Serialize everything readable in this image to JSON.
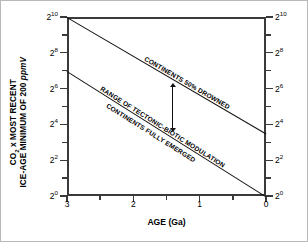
{
  "chart_data": {
    "type": "line",
    "title": "",
    "xlabel": "AGE (Ga)",
    "ylabel_line1": "CO",
    "ylabel_sub": "2",
    "ylabel_line1b": " x MOST RECENT",
    "ylabel_line2": "ICE-AGE MINIMUM OF 200 ",
    "ylabel_line2_italic": "ppmV",
    "xlim": [
      3,
      0
    ],
    "ylim_exponent": [
      0,
      10
    ],
    "y_scale": "log2",
    "grid": false,
    "legend": "none",
    "x_major_ticks": [
      "3",
      "2",
      "1",
      "0"
    ],
    "x_major_values": [
      3,
      2,
      1,
      0
    ],
    "x_minor_values": [
      2.5,
      1.5,
      0.5
    ],
    "y_major_exponents": [
      10,
      8,
      6,
      4,
      2,
      0
    ],
    "y_major_labels": [
      "2",
      "2",
      "2",
      "2",
      "2",
      "2"
    ],
    "y_major_sup": [
      "10",
      "8",
      "6",
      "4",
      "2",
      "0"
    ],
    "y_minor_exponents": [
      9,
      7,
      5,
      3,
      1
    ],
    "axes": {
      "left_label_set": "2^10, 2^8, 2^6, 2^4, 2^2, 2^0",
      "right_label_set": "2^10, 2^8, 2^6, 2^4, 2^2, 2^0"
    },
    "series": [
      {
        "name": "CONTINENTS 50% DROWNED",
        "points": [
          {
            "x": 3,
            "y_exponent": 10
          },
          {
            "x": 0,
            "y_exponent": 3.5
          }
        ]
      },
      {
        "name": "CONTINENTS FULLY EMERGED",
        "points": [
          {
            "x": 3,
            "y_exponent": 7
          },
          {
            "x": 0,
            "y_exponent": 0
          }
        ]
      }
    ],
    "annotations": [
      {
        "text": "CONTINENTS 50% DROWNED",
        "rotation": 18.5
      },
      {
        "text": "RANGE OF TECTONIC-BIOTIC MODULATION",
        "rotation": 18.5
      },
      {
        "text": "CONTINENTS FULLY EMERGED",
        "rotation": 19.5
      },
      {
        "text": "double-headed-arrow",
        "rotation": 0
      }
    ]
  },
  "figure": {
    "border_color": "#b8b8b8",
    "line_color": "#111111",
    "axis_color": "#3a3a3a",
    "background": "#ffffff"
  }
}
